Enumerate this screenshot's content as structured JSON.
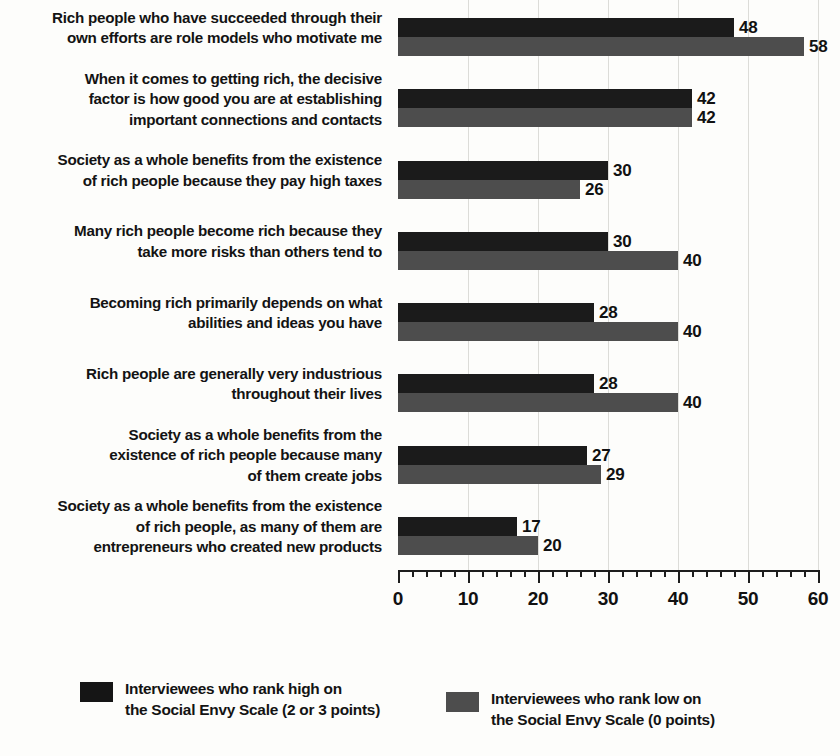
{
  "chart_data": {
    "type": "bar",
    "orientation": "horizontal",
    "title": "",
    "xlabel": "",
    "ylabel": "",
    "xlim": [
      0,
      60
    ],
    "xticks": [
      0,
      10,
      20,
      30,
      40,
      50,
      60
    ],
    "xtick_labels": [
      "0",
      "10",
      "20",
      "30",
      "40",
      "50",
      "60"
    ],
    "minor_tick_step": 2,
    "grid": "vertical-major",
    "legend_position": "bottom",
    "categories": [
      "Rich people who have succeeded through their\nown efforts are role models who motivate me",
      "When it comes to getting rich, the decisive\nfactor is how good you are at establishing\nimportant connections and contacts",
      "Society as a whole benefits from the existence\nof rich people because they pay high taxes",
      "Many rich people become rich because they\ntake more risks than others tend to",
      "Becoming rich primarily depends on what\nabilities and ideas you have",
      "Rich people are generally very industrious\nthroughout their lives",
      "Society as a whole benefits from the\nexistence of rich people because many\nof them create jobs",
      "Society as a whole benefits from the existence\nof rich people, as many of them are\nentrepreneurs who created new products"
    ],
    "series": [
      {
        "name": "Interviewees who rank high on\nthe Social Envy Scale (2 or 3 points)",
        "color": "#1b1b1b",
        "values": [
          48,
          42,
          30,
          30,
          28,
          28,
          27,
          17
        ]
      },
      {
        "name": "Interviewees who rank low on\nthe Social Envy Scale (0 points)",
        "color": "#4d4d4d",
        "values": [
          58,
          42,
          26,
          40,
          40,
          40,
          29,
          20
        ]
      }
    ]
  },
  "legend": {
    "items": [
      {
        "label": "Interviewees who rank high on\nthe Social Envy Scale (2 or 3 points)",
        "swatch": "high"
      },
      {
        "label": "Interviewees who rank low on\nthe Social Envy Scale (0 points)",
        "swatch": "low"
      }
    ]
  }
}
